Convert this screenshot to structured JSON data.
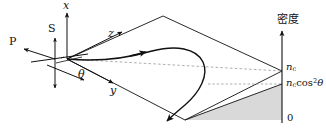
{
  "figure": {
    "name": "oblique-incidence-plasma-density-diagram",
    "background": "#ffffff",
    "stroke_color": "#111111",
    "shade_color": "#d9d9d9",
    "dash_color": "#999999",
    "width": 326,
    "height": 134
  },
  "axes": {
    "x_label": "x",
    "y_label": "y",
    "z_label": "z"
  },
  "polarization": {
    "p_label": "P",
    "s_label": "S"
  },
  "angle": {
    "theta_label": "θ"
  },
  "density_axis": {
    "title": "密度",
    "ticks": [
      {
        "value_label": "n",
        "subscript": "c",
        "suffix": ""
      },
      {
        "value_label": "n",
        "subscript": "c",
        "suffix": "cos",
        "power": "2",
        "angle": "θ"
      },
      {
        "value_label": "0",
        "subscript": "",
        "suffix": ""
      }
    ],
    "tick_nc": "n",
    "tick_nc_sub": "c",
    "tick_nccos_lead": "n",
    "tick_nccos_sub": "c",
    "tick_nccos_cos": "cos",
    "tick_nccos_pow": "2",
    "tick_nccos_theta": "θ",
    "tick_zero": "0"
  },
  "ray": {
    "name": "refracted-ray-path",
    "description": "turning ray trajectory"
  }
}
